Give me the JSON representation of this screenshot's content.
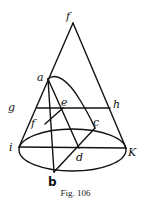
{
  "figure": {
    "caption": "Fig. 106",
    "labels": {
      "f_apex": "f",
      "a": "a",
      "g": "g",
      "e": "e",
      "h": "h",
      "f_inner": "f",
      "c": "c",
      "i": "i",
      "d": "d",
      "K": "K",
      "b": "b"
    }
  }
}
